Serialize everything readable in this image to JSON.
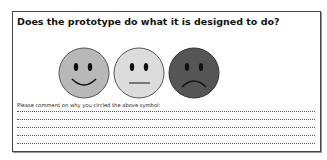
{
  "question": "Does the prototype do what it is designed to do?",
  "faces": [
    {
      "name": "happy",
      "fill": "#b8b8b8"
    },
    {
      "name": "neutral",
      "fill": "#dcdcdc"
    },
    {
      "name": "sad",
      "fill": "#555555"
    }
  ],
  "comment_prompt": "Please comment on why you circled the above symbol:",
  "comment_lines": 5
}
